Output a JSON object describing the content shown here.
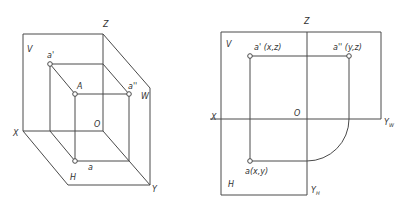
{
  "left_figure": {
    "title": "3D projection planes",
    "labels": {
      "Z": "Z",
      "V": "V",
      "W": "W",
      "H": "H",
      "X": "X",
      "Y": "Y",
      "O": "O",
      "A": "A",
      "a_prime": "a'",
      "a_double_prime": "a''",
      "a": "a"
    }
  },
  "right_figure": {
    "title": "Orthographic projection unfolded",
    "labels": {
      "Z": "Z",
      "V": "V",
      "H": "H",
      "X": "X",
      "O": "O",
      "Y_W_main": "Y",
      "Y_W_sub": "W",
      "Y_H_main": "Y",
      "Y_H_sub": "H",
      "a_prime": "a' (x,z)",
      "a_double_prime": "a'' (y,z)",
      "a": "a(x,y)"
    }
  },
  "colors": {
    "line": "#4a4a4a",
    "text": "#333333",
    "background": "#ffffff"
  }
}
